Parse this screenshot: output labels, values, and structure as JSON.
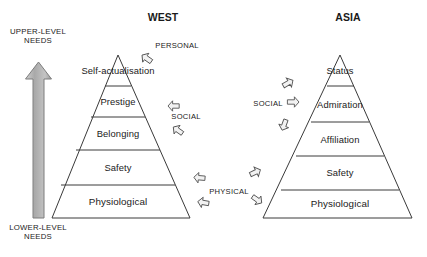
{
  "figure": {
    "type": "diagram"
  },
  "headers": {
    "west": "WEST",
    "asia": "ASIA"
  },
  "axis": {
    "top_label_line1": "UPPER-LEVEL",
    "top_label_line2": "NEEDS",
    "bottom_label_line1": "LOWER-LEVEL",
    "bottom_label_line2": "NEEDS",
    "arrow_direction": "up",
    "arrow_color": "#b3b3b3"
  },
  "west_pyramid": {
    "name": "WEST",
    "tiers": [
      {
        "index": 0,
        "label": "Self-actualisation",
        "position": "apex"
      },
      {
        "index": 1,
        "label": "Prestige"
      },
      {
        "index": 2,
        "label": "Belonging"
      },
      {
        "index": 3,
        "label": "Safety"
      },
      {
        "index": 4,
        "label": "Physiological",
        "position": "base"
      }
    ]
  },
  "asia_pyramid": {
    "name": "ASIA",
    "tiers": [
      {
        "index": 0,
        "label": "Status",
        "position": "apex"
      },
      {
        "index": 1,
        "label": "Admiration"
      },
      {
        "index": 2,
        "label": "Affiliation"
      },
      {
        "index": 3,
        "label": "Safety"
      },
      {
        "index": 4,
        "label": "Physiological",
        "position": "base"
      }
    ]
  },
  "categories": {
    "personal": "PERSONAL",
    "social_west": "SOCIAL",
    "physical": "PHYSICAL",
    "social_asia": "SOCIAL"
  },
  "colors": {
    "stroke": "#3a3a3a",
    "text": "#1a1a1a",
    "background": "#ffffff",
    "arrow_glyph_stroke": "#555555",
    "arrow_glyph_fill": "#f2f2f2"
  }
}
